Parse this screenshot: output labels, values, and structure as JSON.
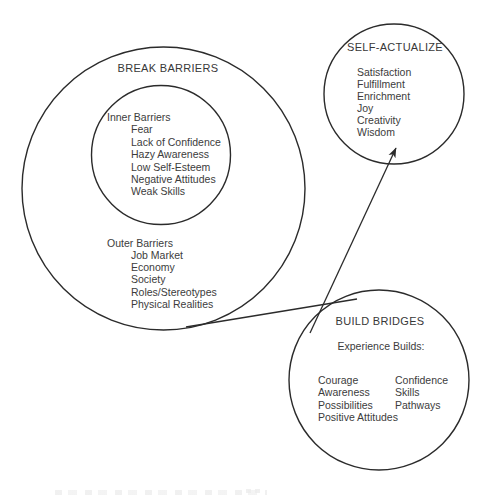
{
  "diagram": {
    "break_barriers": {
      "title": "BREAK BARRIERS",
      "inner": {
        "heading": "Inner Barriers",
        "items": [
          "Fear",
          "Lack of Confidence",
          "Hazy Awareness",
          "Low Self-Esteem",
          "Negative Attitudes",
          "Weak Skills"
        ]
      },
      "outer": {
        "heading": "Outer Barriers",
        "items": [
          "Job Market",
          "Economy",
          "Society",
          "Roles/Stereotypes",
          "Physical Realities"
        ]
      }
    },
    "self_actualize": {
      "title": "SELF-ACTUALIZE",
      "items": [
        "Satisfaction",
        "Fulfillment",
        "Enrichment",
        "Joy",
        "Creativity",
        "Wisdom"
      ]
    },
    "build_bridges": {
      "title": "BUILD BRIDGES",
      "subtitle": "Experience Builds:",
      "columns": {
        "left": [
          "Courage",
          "Awareness",
          "Possibilities",
          "Positive Attitudes"
        ],
        "right": [
          "Confidence",
          "Skills",
          "Pathways"
        ]
      }
    },
    "connectors": {
      "tangent_line": "break-barriers to build-bridges",
      "arrow": "build-bridges to self-actualize"
    },
    "colors": {
      "stroke": "#2b2b2b",
      "text": "#3c3c3c",
      "background": "#ffffff"
    }
  }
}
